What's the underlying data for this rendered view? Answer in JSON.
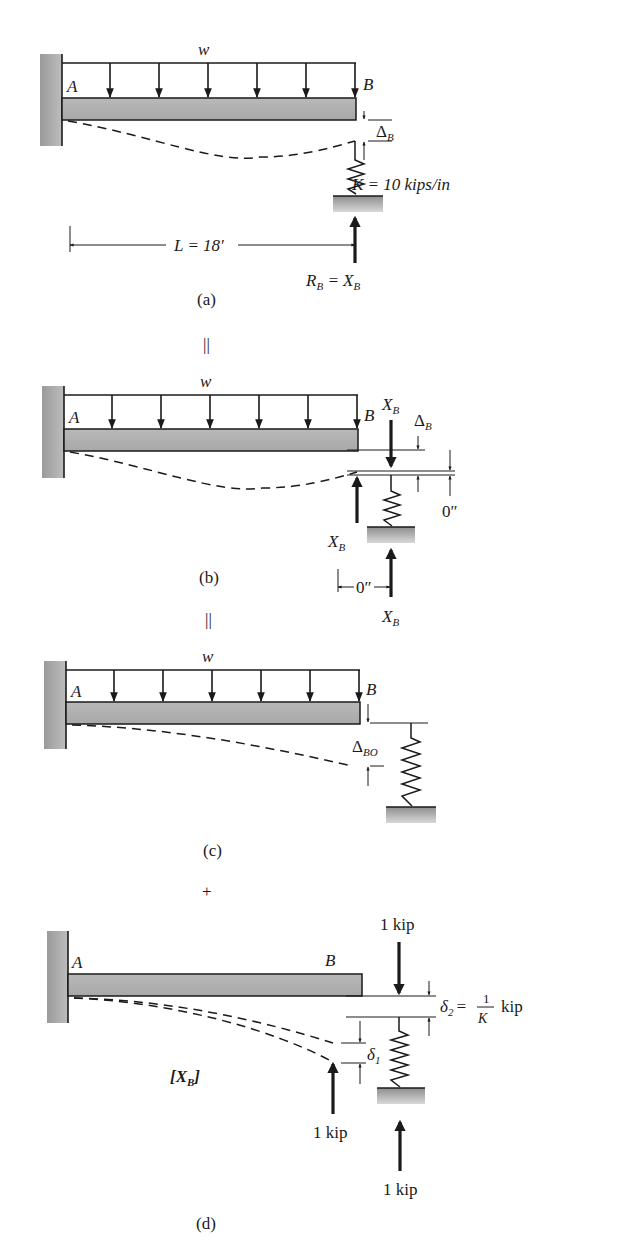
{
  "figure": {
    "panels": [
      {
        "id": "a",
        "caption": "(a)",
        "load_label": "w",
        "support_label": "A",
        "end_label": "B",
        "deflection_label": "Δ",
        "deflection_sub": "B",
        "spring_label": "K = 10 kips/in",
        "span_label": "L = 18′",
        "reaction_label": "R",
        "reaction_sub": "B",
        "reaction_eq": " = X",
        "reaction_eq_sub": "B"
      },
      {
        "id": "b",
        "caption": "(b)",
        "load_label": "w",
        "support_label": "A",
        "end_label": "B",
        "beam_force_label": "X",
        "beam_force_sub": "B",
        "spring_top_force_label": "X",
        "spring_top_force_sub": "B",
        "deflection_label": "Δ",
        "deflection_sub": "B",
        "gap_label": "0″",
        "offset_label": "0″",
        "spring_bottom_force_label": "X",
        "spring_bottom_force_sub": "B"
      },
      {
        "id": "c",
        "caption": "(c)",
        "load_label": "w",
        "support_label": "A",
        "end_label": "B",
        "deflection_label": "Δ",
        "deflection_sub": "BO"
      },
      {
        "id": "d",
        "caption": "(d)",
        "support_label": "A",
        "end_label": "B",
        "redundant_label": "[X",
        "redundant_sub": "B",
        "redundant_close": "]",
        "beam_force_label": "1 kip",
        "spring_top_force_label": "1 kip",
        "spring_bottom_force_label": "1 kip",
        "delta1_label": "δ",
        "delta1_sub": "1",
        "delta2_label": "δ",
        "delta2_sub": "2",
        "delta2_eq": "=",
        "delta2_num": "1",
        "delta2_den": "K",
        "delta2_unit": "kip"
      }
    ],
    "separators": [
      "||",
      "||",
      "+"
    ]
  }
}
